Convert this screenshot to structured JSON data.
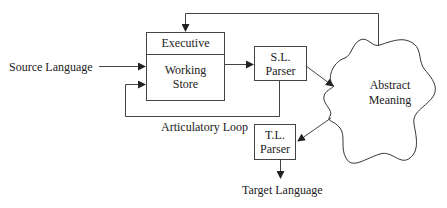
{
  "diagram": {
    "nodes": {
      "source_language": "Source Language",
      "executive": "Executive",
      "working_store_line1": "Working",
      "working_store_line2": "Store",
      "sl_parser_line1": "S.L.",
      "sl_parser_line2": "Parser",
      "abstract_meaning_line1": "Abstract",
      "abstract_meaning_line2": "Meaning",
      "tl_parser_line1": "T.L.",
      "tl_parser_line2": "Parser",
      "target_language": "Target Language"
    },
    "labels": {
      "articulatory_loop": "Articulatory Loop"
    },
    "edges": [
      {
        "from": "Source Language",
        "to": "Working Store"
      },
      {
        "from": "Working Store",
        "to": "S.L. Parser"
      },
      {
        "from": "S.L. Parser",
        "to": "Abstract Meaning"
      },
      {
        "from": "S.L. Parser",
        "to": "Working Store",
        "label": "Articulatory Loop"
      },
      {
        "from": "Abstract Meaning",
        "to": "Executive"
      },
      {
        "from": "Abstract Meaning",
        "to": "T.L. Parser"
      },
      {
        "from": "T.L. Parser",
        "to": "Target Language"
      }
    ],
    "colors": {
      "line": "#333333",
      "text": "#222222",
      "background": "#ffffff"
    }
  }
}
